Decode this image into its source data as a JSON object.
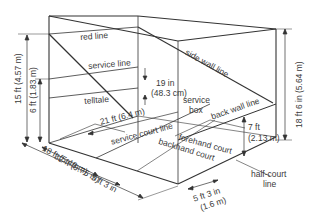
{
  "diagram": {
    "line_color": "#333333",
    "text_color": "#3a3a3a",
    "labels": {
      "red_line": "red line",
      "service_line": "service line",
      "telltale": "telltale",
      "side_wall_line": "side wall line",
      "service_box_1": "service",
      "service_box_2": "box",
      "back_wall_line": "back wall line",
      "service_court_line": "service court line",
      "forehand_court": "forehand court",
      "backhand_court": "backhand court",
      "half_court_line_1": "half-court",
      "half_court_line_2": "line"
    },
    "dimensions": {
      "front_wall_height": "15 ft (4.57 m)",
      "service_line_height": "6 ft (1.83 m)",
      "telltale_height_1": "19 in",
      "telltale_height_2": "(48.3 cm)",
      "court_width": "21 ft (6.4 m)",
      "front_to_short_line": "18 ft (5.49 m)",
      "service_box_depth": "5 ft 3 in",
      "court_length": "32 ft (9.75 m)",
      "back_wall_height_1": "7 ft",
      "back_wall_height_2": "(2.13 m)",
      "back_wall_to_corner": "18 ft 6 in (5.64 m)",
      "service_box_width_1": "5 ft 3 in",
      "service_box_width_2": "(1.6 m)"
    }
  }
}
